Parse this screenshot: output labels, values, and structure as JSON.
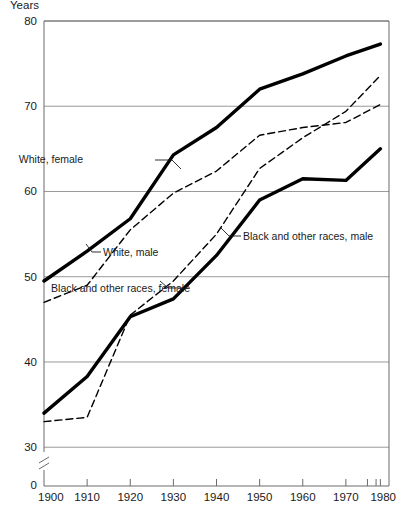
{
  "chart_data": {
    "type": "line",
    "title": "",
    "unit_label": "Years",
    "xlabel": "",
    "ylabel": "",
    "xlim": [
      1900,
      1980
    ],
    "ylim": [
      28.5,
      80
    ],
    "y_axis_break": true,
    "y_zero_label": "0",
    "grid": true,
    "legend_position": "inline-annotations",
    "x_ticks": [
      1900,
      1910,
      1920,
      1930,
      1940,
      1950,
      1960,
      1970,
      1980
    ],
    "x_tick_labels": [
      "1900",
      "1910",
      "1920",
      "1930",
      "1940",
      "1950",
      "1960",
      "1970",
      "1980"
    ],
    "x_minor_ticks": [
      1975,
      1977,
      1978
    ],
    "y_ticks": [
      30,
      40,
      50,
      60,
      70,
      80
    ],
    "y_tick_labels": [
      "30",
      "40",
      "50",
      "60",
      "70",
      "80"
    ],
    "x": [
      1900,
      1910,
      1920,
      1930,
      1940,
      1950,
      1960,
      1970,
      1978
    ],
    "series": [
      {
        "name": "White, female",
        "style": "solid",
        "width": 3.4,
        "color": "#000000",
        "values": [
          49.5,
          53.0,
          56.8,
          64.3,
          67.5,
          72.0,
          73.8,
          75.9,
          77.3
        ],
        "label": "White, female",
        "label_x": 83,
        "label_y": 163,
        "leader": [
          [
            155,
            160
          ],
          [
            172,
            160
          ],
          [
            181,
            169
          ]
        ]
      },
      {
        "name": "White, male",
        "style": "dashed",
        "width": 1.4,
        "color": "#000000",
        "values": [
          47.0,
          49.0,
          55.5,
          59.8,
          62.4,
          66.6,
          67.5,
          68.1,
          70.2
        ],
        "label": "White, male",
        "label_x": 103,
        "label_y": 256,
        "leader": [
          [
            101,
            252
          ],
          [
            92,
            252
          ],
          [
            86,
            244
          ]
        ]
      },
      {
        "name": "Black and other races, male",
        "style": "solid",
        "width": 3.4,
        "color": "#000000",
        "values": [
          34.0,
          38.3,
          45.3,
          47.4,
          52.5,
          59.0,
          61.5,
          61.3,
          65.0
        ],
        "label": "Black and other races, male",
        "label_x": 243,
        "label_y": 240,
        "leader": [
          [
            241,
            236
          ],
          [
            229,
            236
          ],
          [
            221,
            228
          ]
        ]
      },
      {
        "name": "Black and other races, female",
        "style": "dashed",
        "width": 1.4,
        "color": "#000000",
        "values": [
          33.0,
          33.5,
          45.5,
          49.5,
          55.0,
          62.7,
          66.3,
          69.4,
          73.6
        ],
        "label": "Black and other races, female",
        "label_x": 190,
        "label_y": 292,
        "leader": [
          [
            188,
            288
          ],
          [
            168,
            288
          ],
          [
            160,
            281
          ]
        ]
      }
    ]
  }
}
